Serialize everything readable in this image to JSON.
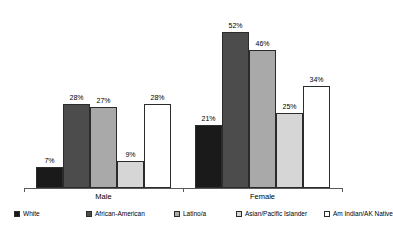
{
  "chart_data": {
    "type": "bar",
    "title": "",
    "subtitle": "",
    "xlabel": "",
    "ylabel": "",
    "ylim": [
      0,
      60
    ],
    "grid": false,
    "legend_position": "bottom",
    "categories": [
      "Male",
      "Female"
    ],
    "series": [
      {
        "name": "White",
        "values": [
          7,
          21
        ],
        "labels": [
          "7%",
          "21%"
        ],
        "color": "#1a1a1a"
      },
      {
        "name": "African-American",
        "values": [
          28,
          52
        ],
        "labels": [
          "28%",
          "52%"
        ],
        "color": "#4c4c4c"
      },
      {
        "name": "Latino/a",
        "values": [
          27,
          46
        ],
        "labels": [
          "27%",
          "46%"
        ],
        "color": "#a9a9a9"
      },
      {
        "name": "Asian/Pacific Islander",
        "values": [
          9,
          25
        ],
        "labels": [
          "9%",
          "25%"
        ],
        "color": "#d6d6d6"
      },
      {
        "name": "Am Indian/AK Native",
        "values": [
          28,
          34
        ],
        "labels": [
          "28%",
          "34%"
        ],
        "color": "#ffffff"
      }
    ]
  },
  "axis": {
    "category_labels": [
      "Male",
      "Female"
    ]
  },
  "legend": {
    "items": [
      {
        "label": "White"
      },
      {
        "label": "African-American"
      },
      {
        "label": "Latino/a"
      },
      {
        "label": "Asian/Pacific Islander"
      },
      {
        "label": "Am Indian/AK Native"
      }
    ]
  }
}
